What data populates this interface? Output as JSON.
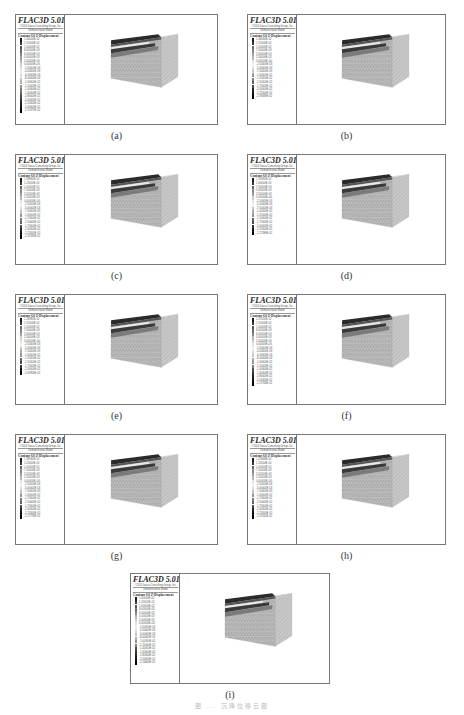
{
  "figure": {
    "caption": "图 ... 沉降位移云图"
  },
  "common": {
    "software_title": "FLAC3D 5.01",
    "company_line": "©2014 Itasca Consulting Group, Inc.",
    "mode_line": "Demonstration Model",
    "contour_title": "Contour Of Z-Displacement"
  },
  "panels": [
    {
      "label": "(a)",
      "legend_values": [
        "1.40000E-02",
        "1.20000E-02",
        "1.00000E-02",
        "8.00000E-03",
        "6.00000E-03",
        "4.00000E-03",
        "2.00000E-03",
        "0.00000E+00",
        "-2.00000E-03",
        "-4.00000E-03",
        "-6.00000E-03",
        "-8.00000E-03",
        "-1.00000E-02",
        "-1.20000E-02",
        "-1.40000E-02",
        "-1.60000E-02",
        "-1.80000E-02",
        "-2.00000E-02",
        "-2.20000E-02",
        "-2.40000E-02",
        "-2.57475E-02"
      ]
    },
    {
      "label": "(b)",
      "legend_values": [
        "1.46660E-02",
        "1.25000E-02",
        "1.00000E-02",
        "7.50000E-03",
        "5.00000E-03",
        "2.50000E-03",
        "0.00000E+00",
        "-2.50000E-03",
        "-5.00000E-03",
        "-7.50000E-03",
        "-1.00000E-02",
        "-1.25000E-02",
        "-1.50000E-02",
        "-1.75000E-02",
        "-2.00000E-02",
        "-2.25000E-02",
        "-2.39483E-02"
      ]
    },
    {
      "label": "(c)",
      "legend_values": [
        "1.39965E-02",
        "1.25000E-02",
        "1.00000E-02",
        "7.50000E-03",
        "5.00000E-03",
        "2.50000E-03",
        "0.00000E+00",
        "-2.50000E-03",
        "-5.00000E-03",
        "-7.50000E-03",
        "-1.00000E-02",
        "-1.25000E-02",
        "-1.50000E-02",
        "-1.75000E-02",
        "-2.00000E-02",
        "-2.25000E-02",
        "-2.37583E-02"
      ]
    },
    {
      "label": "(d)",
      "legend_values": [
        "1.31830E-02",
        "1.00000E-02",
        "7.50000E-03",
        "5.00000E-03",
        "2.50000E-03",
        "0.00000E+00",
        "-2.50000E-03",
        "-5.00000E-03",
        "-7.50000E-03",
        "-1.00000E-02",
        "-1.25000E-02",
        "-1.50000E-02",
        "-1.75000E-02",
        "-2.00000E-02",
        "-2.25000E-02",
        "-2.27586E-02"
      ]
    },
    {
      "label": "(e)",
      "legend_values": [
        "1.28385E-02",
        "1.25000E-02",
        "1.00000E-02",
        "7.50000E-03",
        "5.00000E-03",
        "2.50000E-03",
        "0.00000E+00",
        "-2.50000E-03",
        "-5.00000E-03",
        "-7.50000E-03",
        "-1.00000E-02",
        "-1.25000E-02",
        "-1.50000E-02",
        "-1.75000E-02",
        "-2.00000E-02",
        "-2.05956E-02"
      ]
    },
    {
      "label": "(f)",
      "legend_values": [
        "1.37020E-02",
        "1.20000E-02",
        "1.00000E-02",
        "8.00000E-03",
        "6.00000E-03",
        "4.00000E-03",
        "2.00000E-03",
        "0.00000E+00",
        "-2.00000E-03",
        "-4.00000E-03",
        "-6.00000E-03",
        "-8.00000E-03",
        "-1.00000E-02",
        "-1.20000E-02",
        "-1.40000E-02",
        "-1.60000E-02",
        "-1.80000E-02",
        "-2.00000E-02",
        "-2.21766E-02"
      ]
    },
    {
      "label": "(g)",
      "legend_values": [
        "1.39565E-02",
        "1.25000E-02",
        "1.00000E-02",
        "7.50000E-03",
        "5.00000E-03",
        "2.50000E-03",
        "0.00000E+00",
        "-2.50000E-03",
        "-5.00000E-03",
        "-7.50000E-03",
        "-1.00000E-02",
        "-1.25000E-02",
        "-1.50000E-02",
        "-1.75000E-02",
        "-2.00000E-02",
        "-2.25000E-02",
        "-2.27778E-02"
      ]
    },
    {
      "label": "(h)",
      "legend_values": [
        "1.41868E-02",
        "1.25000E-02",
        "1.00000E-02",
        "7.50000E-03",
        "5.00000E-03",
        "2.50000E-03",
        "0.00000E+00",
        "-2.50000E-03",
        "-5.00000E-03",
        "-7.50000E-03",
        "-1.00000E-02",
        "-1.25000E-02",
        "-1.50000E-02",
        "-1.75000E-02",
        "-2.00000E-02",
        "-2.25000E-02",
        "-2.37042E-02"
      ]
    },
    {
      "label": "(i)",
      "legend_values": [
        "1.40000E-02",
        "1.20000E-02",
        "1.00000E-02",
        "8.00000E-03",
        "6.00000E-03",
        "4.00000E-03",
        "2.00000E-03",
        "0.00000E+00",
        "-2.00000E-03",
        "-4.00000E-03",
        "-6.00000E-03",
        "-8.00000E-03",
        "-1.00000E-02",
        "-1.20000E-02",
        "-1.40000E-02",
        "-1.60000E-02",
        "-1.80000E-02",
        "-2.00000E-02",
        "-2.16604E-02"
      ]
    }
  ]
}
